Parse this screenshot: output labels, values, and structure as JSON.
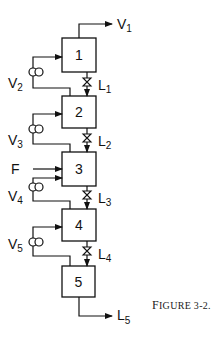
{
  "figure": {
    "caption_first": "F",
    "caption_rest": "IGURE 3-2.",
    "caption_full": "FIGURE 3-2."
  },
  "stages": [
    {
      "id": "1",
      "label": "1"
    },
    {
      "id": "2",
      "label": "2"
    },
    {
      "id": "3",
      "label": "3"
    },
    {
      "id": "4",
      "label": "4"
    },
    {
      "id": "5",
      "label": "5"
    }
  ],
  "streams": {
    "top_vapor": {
      "main": "V",
      "sub": "1"
    },
    "bottom_liquid": {
      "main": "L",
      "sub": "5"
    },
    "feed": {
      "main": "F"
    },
    "vapors": [
      {
        "main": "V",
        "sub": "2"
      },
      {
        "main": "V",
        "sub": "3"
      },
      {
        "main": "V",
        "sub": "4"
      },
      {
        "main": "V",
        "sub": "5"
      }
    ],
    "liquids": [
      {
        "main": "L",
        "sub": "1"
      },
      {
        "main": "L",
        "sub": "2"
      },
      {
        "main": "L",
        "sub": "3"
      },
      {
        "main": "L",
        "sub": "4"
      }
    ]
  },
  "icons": {
    "compressor": "double-circle",
    "valve": "bowtie-valve",
    "arrow": "arrowhead"
  }
}
